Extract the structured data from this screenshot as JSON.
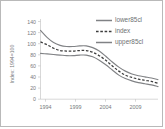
{
  "chart_data": {
    "type": "line",
    "title": "",
    "xlabel": "",
    "ylabel": "Index: 1994=100",
    "xlim": [
      1994,
      2012
    ],
    "ylim": [
      0,
      140
    ],
    "grid": false,
    "legend_position": "top-right",
    "x": [
      1994,
      1995,
      1996,
      1997,
      1998,
      1999,
      2000,
      2001,
      2002,
      2003,
      2004,
      2005,
      2006,
      2007,
      2008,
      2009,
      2010,
      2011,
      2012
    ],
    "xticks": [
      "1994",
      "1999",
      "2004",
      "2009"
    ],
    "xtick_values": [
      1994,
      1999,
      2004,
      2009
    ],
    "yticks": [
      "0",
      "20",
      "40",
      "60",
      "80",
      "100",
      "120",
      "140"
    ],
    "ytick_values": [
      0,
      20,
      40,
      60,
      80,
      100,
      120,
      140
    ],
    "series": [
      {
        "name": "upper85cl",
        "style": "solid",
        "color": "#808285",
        "values": [
          120,
          108,
          99,
          94,
          92,
          92,
          93,
          93,
          90,
          84,
          75,
          65,
          56,
          49,
          44,
          41,
          39,
          37,
          34
        ]
      },
      {
        "name": "index",
        "style": "dashed",
        "color": "#3c3c3c",
        "values": [
          100,
          95,
          89,
          85,
          84,
          84,
          85,
          85,
          82,
          76,
          68,
          58,
          49,
          42,
          38,
          35,
          33,
          31,
          28
        ]
      },
      {
        "name": "lower85cl",
        "style": "solid",
        "color": "#808285",
        "values": [
          80,
          79,
          78,
          77,
          76,
          76,
          77,
          77,
          74,
          68,
          60,
          51,
          42,
          36,
          32,
          29,
          27,
          25,
          22
        ]
      }
    ]
  },
  "legend": {
    "items": [
      {
        "label": "lower85cl",
        "style": "solid"
      },
      {
        "label": "index",
        "style": "dashed"
      },
      {
        "label": "upper85cl",
        "style": "solid"
      }
    ]
  },
  "axes": {
    "y_title": "Index: 1994=100",
    "y_labels": [
      "140",
      "120",
      "100",
      "80",
      "60",
      "40",
      "20",
      "0"
    ],
    "x_labels": [
      "1994",
      "1999",
      "2004",
      "2009"
    ]
  },
  "colors": {
    "band": "#808285",
    "index": "#3c3c3c",
    "axis": "#bdbdbd",
    "text": "#77797b",
    "border": "#b9b9b9"
  }
}
